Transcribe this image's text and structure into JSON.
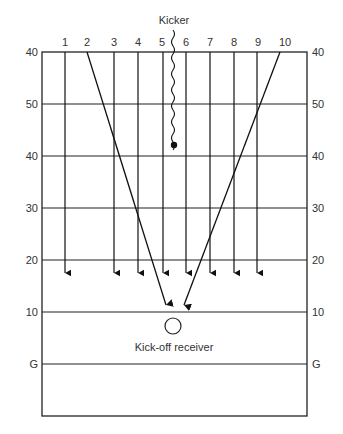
{
  "diagram": {
    "kicker_label": "Kicker",
    "receiver_label": "Kick-off receiver",
    "player_numbers": [
      "1",
      "2",
      "3",
      "4",
      "5",
      "6",
      "7",
      "8",
      "9",
      "10"
    ],
    "yard_lines_left": [
      "40",
      "50",
      "40",
      "30",
      "20",
      "10",
      "G"
    ],
    "yard_lines_right": [
      "40",
      "50",
      "40",
      "30",
      "20",
      "10",
      "G"
    ],
    "colors": {
      "line": "#222222",
      "text": "#333333",
      "background": "#ffffff"
    }
  }
}
